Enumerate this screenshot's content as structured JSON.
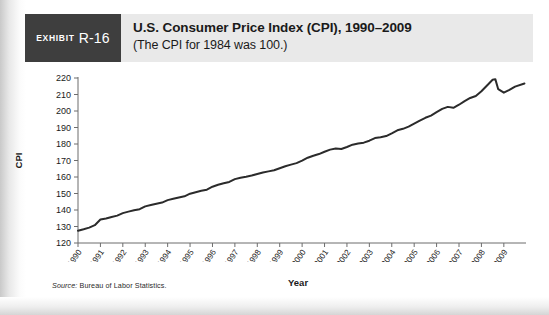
{
  "exhibit": {
    "badge_word": "Exhibit",
    "badge_number": "R-16"
  },
  "header": {
    "title": "U.S. Consumer Price Index (CPI), 1990–2009",
    "subtitle": "(The CPI for 1984 was 100.)"
  },
  "source": {
    "label": "Source:",
    "text": "Bureau of Labor Statistics."
  },
  "chart_data": {
    "type": "line",
    "title": "U.S. Consumer Price Index (CPI), 1990–2009",
    "subtitle": "(The CPI for 1984 was 100.)",
    "xlabel": "Year",
    "ylabel": "CPI",
    "xlim": [
      1990,
      2009.9
    ],
    "ylim": [
      120,
      220
    ],
    "grid": false,
    "legend": false,
    "ytick_labels": [
      "120",
      "130",
      "140",
      "150",
      "160",
      "170",
      "180",
      "190",
      "200",
      "210",
      "220"
    ],
    "ytick_values": [
      120,
      130,
      140,
      150,
      160,
      170,
      180,
      190,
      200,
      210,
      220
    ],
    "xtick_labels": [
      "1990",
      "1991",
      "1992",
      "1993",
      "1994",
      "1995",
      "1996",
      "1997",
      "1998",
      "1999",
      "2000",
      "2001",
      "2002",
      "2003",
      "2004",
      "2005",
      "2006",
      "2007",
      "2008",
      "2009"
    ],
    "xtick_values": [
      1990,
      1991,
      1992,
      1993,
      1994,
      1995,
      1996,
      1997,
      1998,
      1999,
      2000,
      2001,
      2002,
      2003,
      2004,
      2005,
      2006,
      2007,
      2008,
      2009
    ],
    "series": [
      {
        "name": "CPI",
        "color": "#2b2b2b",
        "x": [
          1990.0,
          1990.25,
          1990.5,
          1990.75,
          1991.0,
          1991.25,
          1991.5,
          1991.75,
          1992.0,
          1992.25,
          1992.5,
          1992.75,
          1993.0,
          1993.25,
          1993.5,
          1993.75,
          1994.0,
          1994.25,
          1994.5,
          1994.75,
          1995.0,
          1995.25,
          1995.5,
          1995.75,
          1996.0,
          1996.25,
          1996.5,
          1996.75,
          1997.0,
          1997.25,
          1997.5,
          1997.75,
          1998.0,
          1998.25,
          1998.5,
          1998.75,
          1999.0,
          1999.25,
          1999.5,
          1999.75,
          2000.0,
          2000.25,
          2000.5,
          2000.75,
          2001.0,
          2001.25,
          2001.5,
          2001.75,
          2002.0,
          2002.25,
          2002.5,
          2002.75,
          2003.0,
          2003.25,
          2003.5,
          2003.75,
          2004.0,
          2004.25,
          2004.5,
          2004.75,
          2005.0,
          2005.25,
          2005.5,
          2005.75,
          2006.0,
          2006.25,
          2006.5,
          2006.75,
          2007.0,
          2007.25,
          2007.5,
          2007.75,
          2008.0,
          2008.25,
          2008.5,
          2008.62,
          2008.75,
          2009.0,
          2009.25,
          2009.5,
          2009.92
        ],
        "y": [
          127.4,
          128.3,
          129.3,
          130.8,
          134.2,
          134.9,
          135.8,
          136.6,
          138.1,
          139.0,
          139.8,
          140.5,
          142.2,
          143.0,
          143.8,
          144.5,
          146.0,
          146.8,
          147.6,
          148.3,
          149.9,
          150.8,
          151.7,
          152.3,
          154.1,
          155.3,
          156.2,
          157.0,
          158.7,
          159.6,
          160.2,
          160.9,
          161.8,
          162.7,
          163.4,
          164.1,
          165.3,
          166.5,
          167.5,
          168.4,
          169.9,
          171.7,
          172.9,
          173.9,
          175.3,
          176.6,
          177.3,
          177.0,
          178.2,
          179.6,
          180.3,
          180.8,
          182.0,
          183.6,
          184.1,
          184.8,
          186.5,
          188.3,
          189.2,
          190.5,
          192.3,
          194.2,
          195.9,
          197.2,
          199.3,
          201.3,
          202.5,
          201.9,
          203.8,
          206.0,
          207.9,
          209.1,
          212.0,
          215.5,
          218.9,
          219.3,
          213.2,
          211.1,
          212.8,
          214.8,
          216.7
        ]
      }
    ],
    "notable_points": [
      {
        "label": "start 1990",
        "x": 1990,
        "y": 127.4
      },
      {
        "label": "2008 peak",
        "x": 2008.62,
        "y": 219.3
      },
      {
        "label": "2009 trough",
        "x": 2009.0,
        "y": 211.1
      },
      {
        "label": "end 2009",
        "x": 2009.92,
        "y": 216.7
      }
    ]
  },
  "axis": {
    "x_title": "Year",
    "y_title": "CPI"
  }
}
